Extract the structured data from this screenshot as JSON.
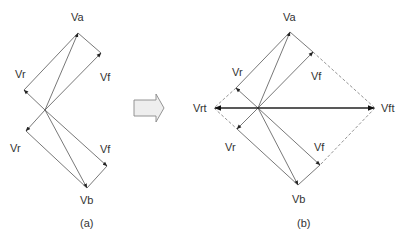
{
  "diagram": {
    "panel_a": {
      "caption": "(a)",
      "labels": {
        "va": "Va",
        "vr_upper": "Vr",
        "vf_upper": "Vf",
        "vr_lower": "Vr",
        "vf_lower": "Vf",
        "vb": "Vb"
      }
    },
    "transition_arrow": {
      "icon": "block-arrow-right-icon",
      "fill": "#eeeeee",
      "stroke": "#888888"
    },
    "panel_b": {
      "caption": "(b)",
      "labels": {
        "va": "Va",
        "vr_upper": "Vr",
        "vf_upper": "Vf",
        "vrt": "Vrt",
        "vft": "Vft",
        "vr_lower": "Vr",
        "vf_lower": "Vf",
        "vb": "Vb"
      }
    },
    "colors": {
      "line": "#555555",
      "bold_line": "#222222",
      "dashed_line": "#777777",
      "text": "#333333"
    }
  }
}
